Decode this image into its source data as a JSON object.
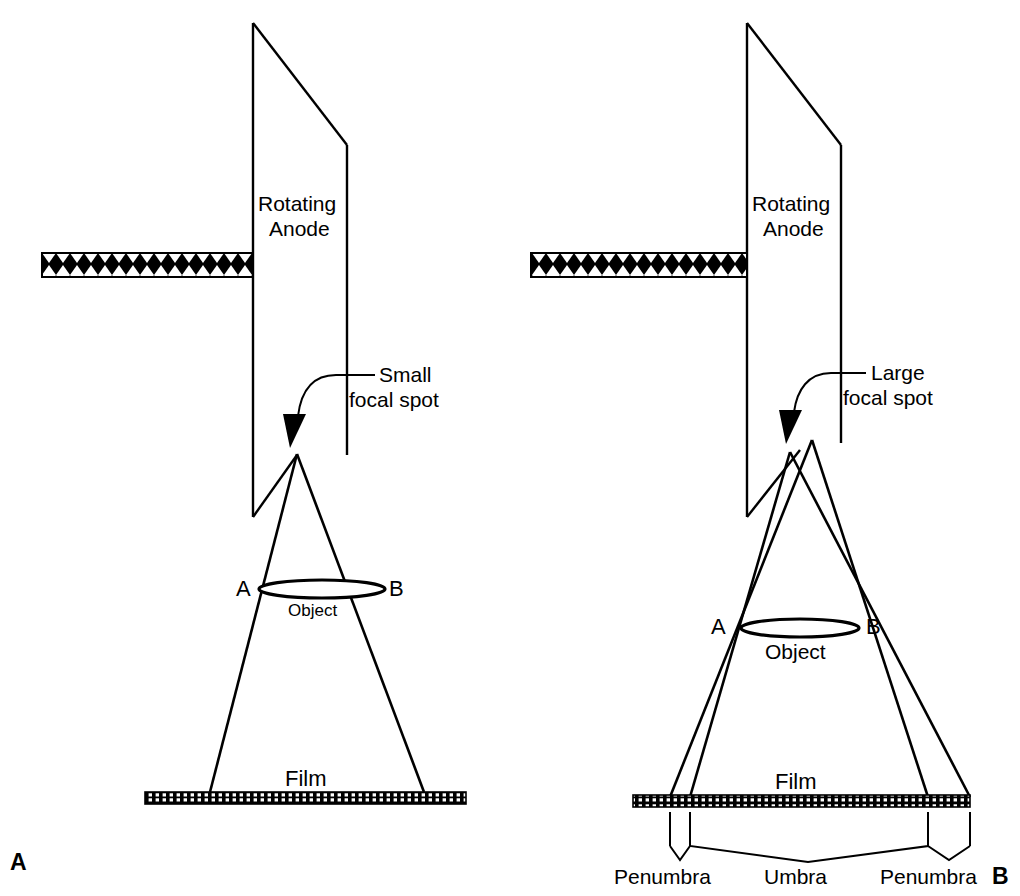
{
  "figure": {
    "width": 1020,
    "height": 896,
    "background": "#ffffff",
    "ink": "#000000"
  },
  "panels": [
    {
      "id": "A",
      "panel_label": "A",
      "anode_label_line1": "Rotating",
      "anode_label_line2": "Anode",
      "focal_spot_label_line1": "Small",
      "focal_spot_label_line2": "focal spot",
      "object_label": "Object",
      "point_a_label": "A",
      "point_b_label": "B",
      "film_label": "Film",
      "focal_spot_kind": "small",
      "focal_spot_points": 1,
      "shows_penumbra": false
    },
    {
      "id": "B",
      "panel_label": "B",
      "anode_label_line1": "Rotating",
      "anode_label_line2": "Anode",
      "focal_spot_label_line1": "Large",
      "focal_spot_label_line2": "focal spot",
      "object_label": "Object",
      "point_a_label": "A",
      "point_b_label": "B",
      "film_label": "Film",
      "focal_spot_kind": "large",
      "focal_spot_points": 2,
      "shows_penumbra": true,
      "penumbra_label_left": "Penumbra",
      "umbra_label": "Umbra",
      "penumbra_label_right": "Penumbra"
    }
  ],
  "elements": {
    "electron_beam_pattern": "crosshatch",
    "film_pattern": "dotted-bar",
    "object_shape": "ellipse",
    "curved_arrow": "pointer-to-focal-spot"
  }
}
